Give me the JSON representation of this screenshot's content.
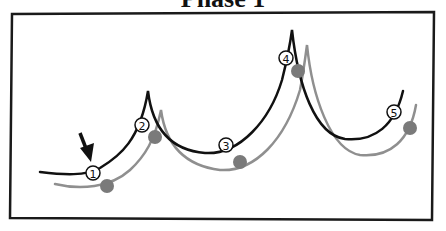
{
  "title": "Phase 1",
  "colors": {
    "primary_curve": "#111111",
    "secondary_curve": "#8f8f8f",
    "dot_fill": "#7a7a7a",
    "frame": "#1a1a1a",
    "marker_fill": "#ffffff"
  },
  "markers": [
    {
      "label": "1",
      "x": 93,
      "y": 173
    },
    {
      "label": "2",
      "x": 142,
      "y": 125
    },
    {
      "label": "3",
      "x": 226,
      "y": 145
    },
    {
      "label": "4",
      "x": 286,
      "y": 58
    },
    {
      "label": "5",
      "x": 394,
      "y": 112
    }
  ],
  "gray_dots": [
    {
      "x": 107,
      "y": 186
    },
    {
      "x": 155,
      "y": 137
    },
    {
      "x": 240,
      "y": 162
    },
    {
      "x": 298,
      "y": 71
    },
    {
      "x": 410,
      "y": 128
    }
  ],
  "arrow": {
    "from": [
      80,
      133
    ],
    "to": [
      91,
      162
    ]
  }
}
